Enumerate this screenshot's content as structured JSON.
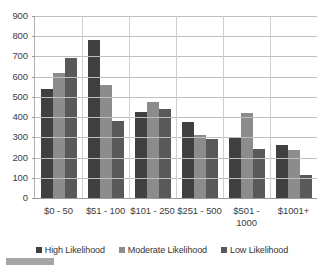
{
  "chart_data": {
    "type": "bar",
    "title": "",
    "subtitle": "",
    "xlabel": "",
    "ylabel": "",
    "categories": [
      "$0 - 50",
      "$51 - 100",
      "$101 - 250",
      "$251 - 500",
      "$501 - 1000",
      "$1001+"
    ],
    "series": [
      {
        "name": "High Likelihood",
        "color": "#404040",
        "values": [
          540,
          780,
          425,
          378,
          300,
          260
        ]
      },
      {
        "name": "Moderate Likelihood",
        "color": "#8c8c8c",
        "values": [
          620,
          560,
          475,
          310,
          420,
          235
        ]
      },
      {
        "name": "Low Likelihood",
        "color": "#595959",
        "values": [
          690,
          380,
          440,
          292,
          240,
          115
        ]
      }
    ],
    "ylim": [
      0,
      900
    ],
    "y_tick_step": 100,
    "y_ticks": [
      900,
      800,
      700,
      600,
      500,
      400,
      300,
      200,
      100,
      0
    ],
    "y_tick_labels": [
      "900",
      "800",
      "700",
      "600",
      "500",
      "400",
      "300",
      "200",
      "100",
      "0"
    ],
    "grid": true,
    "grid_axis": "y",
    "legend_position": "bottom",
    "bar_orientation": "vertical",
    "background_color": "#ffffff",
    "gridline_color": "#bfbfbf",
    "axis_color": "#9a9a9a",
    "text_color": "#404040"
  },
  "legend": {
    "items": [
      {
        "label": "High Likelihood"
      },
      {
        "label": "Moderate Likelihood"
      },
      {
        "label": "Low Likelihood"
      }
    ]
  }
}
